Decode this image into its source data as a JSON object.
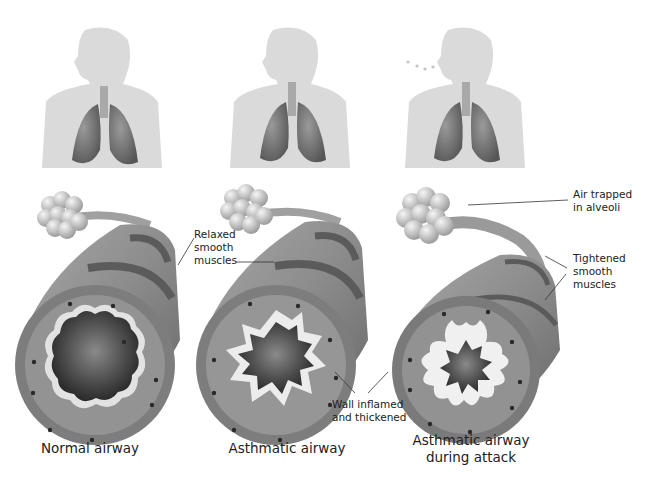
{
  "figure": {
    "panels": [
      {
        "id": "normal",
        "caption": "Normal airway"
      },
      {
        "id": "asthmatic",
        "caption": "Asthmatic airway"
      },
      {
        "id": "attack",
        "caption_line1": "Asthmatic airway",
        "caption_line2": "during attack"
      }
    ],
    "annotations": {
      "relaxed": {
        "line1": "Relaxed",
        "line2": "smooth",
        "line3": "muscles"
      },
      "air_trapped": {
        "line1": "Air trapped",
        "line2": "in alveoli"
      },
      "tightened": {
        "line1": "Tightened",
        "line2": "smooth",
        "line3": "muscles"
      },
      "wall_inflamed": {
        "line1": "Wall inflamed",
        "line2": "and thickened"
      }
    },
    "colors": {
      "silhouette": "#d9d9d9",
      "lung": "#6e6e6e",
      "airway_wall": "#8a8a8a",
      "muscle_band": "#5a5a5a",
      "lumen_dark": "#2e2e2e",
      "mucosa": "#e8e8e8",
      "alveoli": "#cfcfcf"
    }
  }
}
